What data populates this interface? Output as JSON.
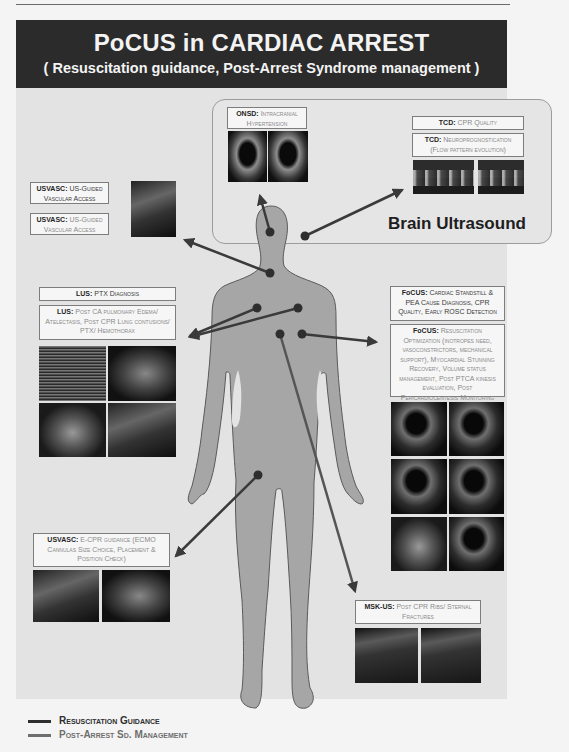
{
  "header": {
    "title": "PoCUS in CARDIAC ARREST",
    "subtitle": "( Resuscitation guidance, Post-Arrest Syndrome management )"
  },
  "brain_section": {
    "label": "Brain Ultrasound",
    "onsd": {
      "tag": "ONSD:",
      "text": "Intracranial Hypertension"
    },
    "tcd_cpr": {
      "tag": "TCD:",
      "text": "CPR Quality"
    },
    "tcd_neuro": {
      "tag": "TCD:",
      "text": "Neuroprognostication (Flow pattern evolution)"
    }
  },
  "usvasc_access": [
    {
      "tag": "USVASC:",
      "text": "US-Guided Vascular Access"
    },
    {
      "tag": "USVASC:",
      "text": "US-Guided Vascular Access"
    }
  ],
  "lus": [
    {
      "tag": "LUS:",
      "text": "PTX Diagnosis"
    },
    {
      "tag": "LUS:",
      "text": "Post CA pulmonary Edema/ Atelectasis, Post CPR Lung contusions/ PTX/ Hemothorax"
    }
  ],
  "focus": [
    {
      "tag": "FoCUS:",
      "text": "Cardiac Standstill & PEA Cause Diagnosis, CPR Quality, Early ROSC Detection"
    },
    {
      "tag": "FoCUS:",
      "text": "Resuscitation Optimization (inotropes need, vasoconstrictors, mechanical support), Myocardial Stunning Recovery, Volume status management, Post PTCA kinesis evaluation, Post Pericardiocentesis Monitoring"
    }
  ],
  "ecpr": {
    "tag": "USVASC:",
    "text": "E-CPR guidance (ECMO Cannulas Size Choice, Placement & Position Check)"
  },
  "msk": {
    "tag": "MSK-US:",
    "text": "Post CPR Ribs/ Sternal Fractures"
  },
  "legend": {
    "items": [
      {
        "label": "Resuscitation Guidance",
        "color": "#2e2e2e"
      },
      {
        "label": "Post-Arrest Sd. Management",
        "color": "#6e6e6e"
      }
    ]
  },
  "colors": {
    "header_bg": "#2b2b2b",
    "panel_bg": "#e3e3e3",
    "body_fill": "#a6a6a6",
    "arrow": "#3a3a3a"
  }
}
